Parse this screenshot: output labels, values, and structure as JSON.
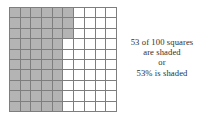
{
  "figure": {
    "colors": {
      "shaded": "#b4b4b4",
      "unshaded": "#ffffff",
      "gridline": "#7e7e7e",
      "text": "#2e2e2e"
    }
  },
  "caption": {
    "lines": [
      "53 of 100 squares",
      "are shaded",
      "or",
      "53% is shaded"
    ],
    "line1": "53 of 100 squares",
    "line2": "are shaded",
    "line3": "or",
    "line4": "53% is shaded"
  },
  "chart_data": {
    "type": "heatmap",
    "title": "53 of 100 squares are shaded",
    "xlabel": "",
    "ylabel": "",
    "rows": 10,
    "columns": 10,
    "total_squares": 100,
    "shaded_squares": 53,
    "unshaded_squares": 47,
    "percent_shaded": 53,
    "percent_unshaded": 47,
    "legend": [
      "shaded",
      "unshaded"
    ],
    "grid": true,
    "shaded_per_row": [
      6,
      6,
      6,
      5,
      5,
      5,
      5,
      5,
      5,
      5
    ],
    "matrix": [
      [
        1,
        1,
        1,
        1,
        1,
        1,
        0,
        0,
        0,
        0
      ],
      [
        1,
        1,
        1,
        1,
        1,
        1,
        0,
        0,
        0,
        0
      ],
      [
        1,
        1,
        1,
        1,
        1,
        1,
        0,
        0,
        0,
        0
      ],
      [
        1,
        1,
        1,
        1,
        1,
        0,
        0,
        0,
        0,
        0
      ],
      [
        1,
        1,
        1,
        1,
        1,
        0,
        0,
        0,
        0,
        0
      ],
      [
        1,
        1,
        1,
        1,
        1,
        0,
        0,
        0,
        0,
        0
      ],
      [
        1,
        1,
        1,
        1,
        1,
        0,
        0,
        0,
        0,
        0
      ],
      [
        1,
        1,
        1,
        1,
        1,
        0,
        0,
        0,
        0,
        0
      ],
      [
        1,
        1,
        1,
        1,
        1,
        0,
        0,
        0,
        0,
        0
      ],
      [
        1,
        1,
        1,
        1,
        1,
        0,
        0,
        0,
        0,
        0
      ]
    ]
  }
}
